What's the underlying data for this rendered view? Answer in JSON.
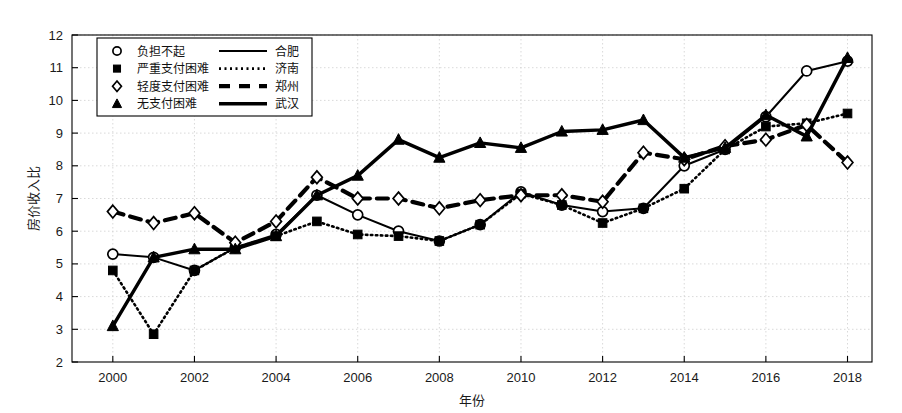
{
  "chart_data": {
    "type": "line",
    "title": "",
    "xlabel": "年份",
    "ylabel": "房价收入比",
    "grid": true,
    "legend_position": "top-left",
    "xlim": [
      1999,
      2018.6
    ],
    "ylim": [
      2,
      12
    ],
    "yticks": [
      2,
      3,
      4,
      5,
      6,
      7,
      8,
      9,
      10,
      11,
      12
    ],
    "xticks": [
      2000,
      2002,
      2004,
      2006,
      2008,
      2010,
      2012,
      2014,
      2016,
      2018
    ],
    "x": [
      2000,
      2001,
      2002,
      2003,
      2004,
      2005,
      2006,
      2007,
      2008,
      2009,
      2010,
      2011,
      2012,
      2013,
      2014,
      2015,
      2016,
      2017,
      2018
    ],
    "series": [
      {
        "name": "合肥",
        "marker": "circle-open",
        "linestyle": "solid",
        "color": "#000000",
        "values": [
          5.3,
          5.2,
          4.8,
          5.5,
          5.9,
          7.1,
          6.5,
          6.0,
          5.7,
          6.2,
          7.2,
          6.8,
          6.6,
          6.7,
          8.0,
          8.5,
          9.5,
          10.9,
          11.2
        ]
      },
      {
        "name": "济南",
        "marker": "square-filled",
        "linestyle": "dotted",
        "color": "#000000",
        "values": [
          4.8,
          2.85,
          4.8,
          5.5,
          5.85,
          6.3,
          5.9,
          5.85,
          5.7,
          6.2,
          7.15,
          6.8,
          6.25,
          6.7,
          7.3,
          8.5,
          9.2,
          9.3,
          9.6
        ]
      },
      {
        "name": "郑州",
        "marker": "diamond-open",
        "linestyle": "dashed",
        "color": "#000000",
        "values": [
          6.6,
          6.25,
          6.55,
          5.65,
          6.3,
          7.65,
          7.0,
          7.0,
          6.7,
          6.95,
          7.1,
          7.1,
          6.9,
          8.4,
          8.2,
          8.6,
          8.8,
          9.25,
          8.1
        ]
      },
      {
        "name": "武汉",
        "marker": "triangle-filled",
        "linestyle": "solid-thick",
        "color": "#000000",
        "values": [
          3.1,
          5.2,
          5.45,
          5.45,
          5.85,
          7.1,
          7.7,
          8.8,
          8.25,
          8.7,
          8.55,
          9.05,
          9.1,
          9.4,
          8.25,
          8.55,
          9.55,
          8.9,
          11.3
        ]
      }
    ],
    "legend": [
      {
        "marker": "circle-open",
        "marker_label": "负担不起",
        "line": "solid",
        "line_label": "合肥"
      },
      {
        "marker": "square-filled",
        "marker_label": "严重支付困难",
        "line": "dotted",
        "line_label": "济南"
      },
      {
        "marker": "diamond-open",
        "marker_label": "轻度支付困难",
        "line": "dashed",
        "line_label": "郑州"
      },
      {
        "marker": "triangle-filled",
        "marker_label": "无支付困难",
        "line": "solid-thick",
        "line_label": "武汉"
      }
    ]
  }
}
